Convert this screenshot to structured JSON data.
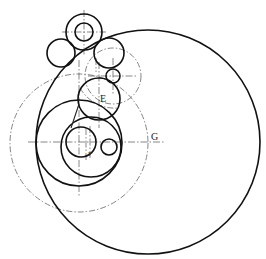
{
  "diagram": {
    "labels": {
      "E": "E",
      "G": "G",
      "F": "F"
    },
    "colors": {
      "solid": "#111111",
      "construction": "#777777",
      "background": "#ffffff"
    },
    "circles": [
      {
        "id": "large-outer",
        "cx": 148,
        "cy": 142,
        "r": 112,
        "style": "solid"
      },
      {
        "id": "gear-outer",
        "cx": 84,
        "cy": 32,
        "r": 18,
        "style": "solid"
      },
      {
        "id": "gear-inner",
        "cx": 84,
        "cy": 32,
        "r": 9,
        "style": "solid"
      },
      {
        "id": "left-small",
        "cx": 61,
        "cy": 53,
        "r": 14,
        "style": "solid"
      },
      {
        "id": "right-of-gear",
        "cx": 109,
        "cy": 53,
        "r": 15,
        "style": "solid"
      },
      {
        "id": "upper-construction",
        "cx": 113,
        "cy": 76,
        "r": 28,
        "style": "dash"
      },
      {
        "id": "tiny",
        "cx": 113,
        "cy": 76,
        "r": 7,
        "style": "solid"
      },
      {
        "id": "circle-E",
        "cx": 99,
        "cy": 99,
        "r": 21,
        "style": "solid"
      },
      {
        "id": "big-construction",
        "cx": 79,
        "cy": 143,
        "r": 69,
        "style": "dash"
      },
      {
        "id": "medium",
        "cx": 79,
        "cy": 143,
        "r": 43,
        "style": "solid"
      },
      {
        "id": "inner",
        "cx": 91,
        "cy": 147,
        "r": 30,
        "style": "solid"
      },
      {
        "id": "inner-small",
        "cx": 81,
        "cy": 142,
        "r": 15,
        "style": "solid"
      },
      {
        "id": "right-small",
        "cx": 109,
        "cy": 147,
        "r": 8,
        "style": "solid"
      }
    ]
  }
}
